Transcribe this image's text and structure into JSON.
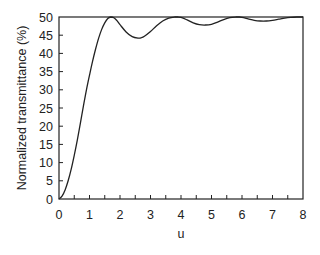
{
  "chart_data": {
    "type": "line",
    "title": "",
    "xlabel": "u",
    "ylabel": "Normalized transmittance (%)",
    "xlim": [
      0,
      8
    ],
    "ylim": [
      0,
      50
    ],
    "xticks": [
      0,
      1,
      2,
      3,
      4,
      5,
      6,
      7,
      8
    ],
    "yticks": [
      0,
      5,
      10,
      15,
      20,
      25,
      30,
      35,
      40,
      45,
      50
    ],
    "x_minor_step": 0.5,
    "grid": false,
    "legend": null,
    "series": [
      {
        "name": "transmittance",
        "color": "#222222",
        "x": [
          0,
          0.1,
          0.2,
          0.3,
          0.4,
          0.5,
          0.6,
          0.7,
          0.8,
          0.9,
          1.0,
          1.1,
          1.2,
          1.3,
          1.4,
          1.5,
          1.6,
          1.7,
          1.8,
          1.9,
          2.0,
          2.2,
          2.4,
          2.6,
          2.7,
          2.8,
          3.0,
          3.2,
          3.4,
          3.6,
          3.8,
          3.9,
          4.0,
          4.2,
          4.4,
          4.6,
          4.8,
          5.0,
          5.2,
          5.4,
          5.6,
          5.8,
          5.9,
          6.0,
          6.2,
          6.4,
          6.6,
          6.8,
          7.0,
          7.2,
          7.4,
          7.6,
          7.8,
          8.0
        ],
        "y": [
          0,
          0.8,
          2.5,
          5.0,
          8.2,
          12.0,
          16.2,
          20.8,
          25.5,
          30.0,
          34.0,
          37.8,
          41.2,
          44.2,
          46.6,
          48.4,
          49.6,
          50.0,
          49.8,
          49.0,
          47.9,
          45.9,
          44.6,
          44.2,
          44.3,
          44.7,
          46.0,
          47.6,
          48.9,
          49.7,
          50.0,
          50.0,
          49.9,
          49.2,
          48.4,
          47.9,
          47.8,
          48.0,
          48.6,
          49.3,
          49.8,
          50.0,
          50.0,
          49.9,
          49.5,
          49.1,
          48.9,
          48.9,
          49.1,
          49.4,
          49.7,
          49.9,
          50.0,
          50.0
        ]
      }
    ],
    "annotations": []
  }
}
